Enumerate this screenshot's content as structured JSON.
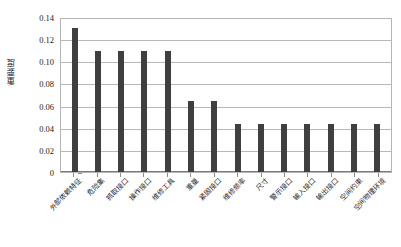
{
  "chart_data": {
    "type": "bar",
    "title": "",
    "xlabel": "",
    "ylabel": "重要度",
    "ylim": [
      0,
      0.14
    ],
    "yticks": [
      "0",
      "0.02",
      "0.04",
      "0.06",
      "0.08",
      "0.10",
      "0.12",
      "0.14"
    ],
    "ytick_values": [
      0,
      0.02,
      0.04,
      0.06,
      0.08,
      0.1,
      0.12,
      0.14
    ],
    "grid": "horizontal",
    "legend": "none",
    "bar_color": "#3f3f3f",
    "categories": [
      "外部依赖特征",
      "危险集",
      "抓取接口",
      "操作接口",
      "维修工具",
      "重量",
      "紧固接口",
      "维修频率",
      "尺寸",
      "警示接口",
      "输入接口",
      "输出接口",
      "空间约束",
      "空间物理环境"
    ],
    "values": [
      0.13,
      0.109,
      0.109,
      0.109,
      0.109,
      0.0645,
      0.0645,
      0.0435,
      0.0435,
      0.0435,
      0.0435,
      0.0435,
      0.0435,
      0.0435
    ]
  }
}
